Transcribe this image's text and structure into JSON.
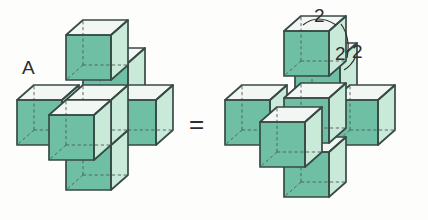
{
  "figure": {
    "type": "geometry-diagram",
    "background_color": "#fdfdfb",
    "labels": {
      "solid_name": "A",
      "equals": "=",
      "dimension_top": "2",
      "dimension_front": "2",
      "dimension_side": "2"
    },
    "colors": {
      "face_front": "#6fbfa5",
      "face_right": "#c9ead9",
      "face_top": "#f2f7f4",
      "edge": "#384a46",
      "hidden_edge": "#4a5c57",
      "label": "#2d2d2d"
    },
    "geometry": {
      "cube_count": 7,
      "arrangement": "3D plus / cross (one center cube with six face-adjacent cubes)",
      "edge_length": 2,
      "projection": "oblique cabinet, depth offset (+17,-15) px",
      "cube_px_size": 45
    },
    "left_figure": {
      "caption": "A",
      "exploded": false
    },
    "right_figure": {
      "exploded": true,
      "dimension_labels": [
        "2",
        "2",
        "2"
      ]
    }
  }
}
